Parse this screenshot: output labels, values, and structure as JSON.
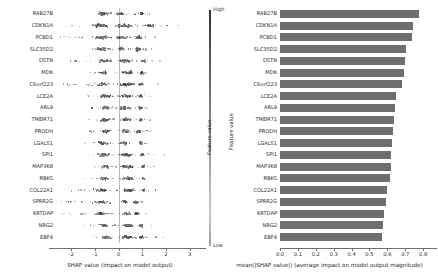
{
  "chart_data": [
    {
      "type": "scatter",
      "subtype": "shap-beeswarm",
      "title": "",
      "xlabel": "SHAP value (impact on model output)",
      "ylabel": "",
      "xlim": [
        -2.6,
        3.35
      ],
      "xticks": [
        -2,
        -1,
        0,
        1,
        2,
        3
      ],
      "xticklabels": [
        "-2",
        "-1",
        "0",
        "1",
        "2",
        "3"
      ],
      "grid": false,
      "zero_line": 0,
      "categories": [
        "RAB27B",
        "CDKN1A",
        "PCBD1",
        "SLC35D2",
        "DSTN",
        "MDK",
        "C6orf223",
        "LCE2A",
        "ARL9",
        "TMEM71",
        "PRODH",
        "LGALS1",
        "SPI1",
        "MAP3K8",
        "RBKS",
        "COL22A1",
        "SPRR2G",
        "KRTDAP",
        "NRG2",
        "EBF4"
      ],
      "colorbar": {
        "title": "Feature value",
        "high_label": "High",
        "low_label": "Low"
      },
      "series": [
        {
          "name": "RAB27B",
          "spread": [
            -1.05,
            1.35
          ],
          "clusters": [
            {
              "center": -0.62,
              "width": 0.42,
              "n": 44
            },
            {
              "center": 0.05,
              "width": 0.5,
              "n": 30
            },
            {
              "center": 0.98,
              "width": 0.2,
              "n": 26
            }
          ]
        },
        {
          "name": "CDKN1A",
          "spread": [
            -2.25,
            2.95
          ],
          "clusters": [
            {
              "center": -0.75,
              "width": 0.75,
              "n": 60
            },
            {
              "center": 0.25,
              "width": 0.85,
              "n": 58
            },
            {
              "center": 1.3,
              "width": 0.6,
              "n": 24
            }
          ]
        },
        {
          "name": "PCBD1",
          "spread": [
            -2.45,
            1.55
          ],
          "clusters": [
            {
              "center": -0.72,
              "width": 0.8,
              "n": 46
            },
            {
              "center": 0.12,
              "width": 0.45,
              "n": 26
            },
            {
              "center": 0.85,
              "width": 0.26,
              "n": 34
            }
          ]
        },
        {
          "name": "SLC35D2",
          "spread": [
            -1.6,
            1.45
          ],
          "clusters": [
            {
              "center": -0.7,
              "width": 0.6,
              "n": 40
            },
            {
              "center": 0.1,
              "width": 0.45,
              "n": 24
            },
            {
              "center": 0.82,
              "width": 0.24,
              "n": 36
            }
          ]
        },
        {
          "name": "DSTN",
          "spread": [
            -2.15,
            1.75
          ],
          "clusters": [
            {
              "center": -0.58,
              "width": 0.55,
              "n": 48
            },
            {
              "center": 0.3,
              "width": 0.7,
              "n": 50
            },
            {
              "center": 1.05,
              "width": 0.28,
              "n": 20
            }
          ]
        },
        {
          "name": "MDK",
          "spread": [
            -1.25,
            1.45
          ],
          "clusters": [
            {
              "center": -0.62,
              "width": 0.32,
              "n": 40
            },
            {
              "center": 0.38,
              "width": 0.55,
              "n": 48
            },
            {
              "center": 1.0,
              "width": 0.22,
              "n": 18
            }
          ]
        },
        {
          "name": "C6orf223",
          "spread": [
            -2.35,
            1.7
          ],
          "clusters": [
            {
              "center": -0.7,
              "width": 0.6,
              "n": 38
            },
            {
              "center": 0.35,
              "width": 0.62,
              "n": 56
            },
            {
              "center": 0.95,
              "width": 0.28,
              "n": 22
            }
          ]
        },
        {
          "name": "LCE2A",
          "spread": [
            -1.35,
            1.4
          ],
          "clusters": [
            {
              "center": -0.58,
              "width": 0.48,
              "n": 44
            },
            {
              "center": 0.35,
              "width": 0.55,
              "n": 46
            },
            {
              "center": 0.92,
              "width": 0.2,
              "n": 16
            }
          ]
        },
        {
          "name": "ARL9",
          "spread": [
            -1.15,
            1.3
          ],
          "clusters": [
            {
              "center": -0.55,
              "width": 0.38,
              "n": 42
            },
            {
              "center": 0.3,
              "width": 0.45,
              "n": 34
            },
            {
              "center": 0.92,
              "width": 0.18,
              "n": 24
            }
          ]
        },
        {
          "name": "TMEM71",
          "spread": [
            -1.25,
            1.45
          ],
          "clusters": [
            {
              "center": -0.58,
              "width": 0.4,
              "n": 44
            },
            {
              "center": 0.35,
              "width": 0.52,
              "n": 42
            },
            {
              "center": 0.95,
              "width": 0.2,
              "n": 20
            }
          ]
        },
        {
          "name": "PRODH",
          "spread": [
            -1.3,
            1.35
          ],
          "clusters": [
            {
              "center": -0.55,
              "width": 0.42,
              "n": 46
            },
            {
              "center": 0.28,
              "width": 0.4,
              "n": 28
            },
            {
              "center": 0.85,
              "width": 0.22,
              "n": 28
            }
          ]
        },
        {
          "name": "LGALS1",
          "spread": [
            -1.45,
            1.3
          ],
          "clusters": [
            {
              "center": -0.62,
              "width": 0.45,
              "n": 44
            },
            {
              "center": 0.2,
              "width": 0.42,
              "n": 24
            },
            {
              "center": 0.95,
              "width": 0.18,
              "n": 26
            }
          ]
        },
        {
          "name": "SPI1",
          "spread": [
            -1.55,
            2.35
          ],
          "clusters": [
            {
              "center": -0.6,
              "width": 0.52,
              "n": 50
            },
            {
              "center": 0.35,
              "width": 0.6,
              "n": 42
            },
            {
              "center": 1.0,
              "width": 0.26,
              "n": 18
            }
          ]
        },
        {
          "name": "MAP3K8",
          "spread": [
            -1.15,
            1.55
          ],
          "clusters": [
            {
              "center": -0.55,
              "width": 0.35,
              "n": 38
            },
            {
              "center": 0.38,
              "width": 0.62,
              "n": 52
            },
            {
              "center": 1.05,
              "width": 0.22,
              "n": 16
            }
          ]
        },
        {
          "name": "RBKS",
          "spread": [
            -1.45,
            1.45
          ],
          "clusters": [
            {
              "center": -0.6,
              "width": 0.5,
              "n": 34
            },
            {
              "center": 0.45,
              "width": 0.55,
              "n": 50
            },
            {
              "center": 1.05,
              "width": 0.2,
              "n": 16
            }
          ]
        },
        {
          "name": "COL22A1",
          "spread": [
            -2.3,
            1.55
          ],
          "clusters": [
            {
              "center": -0.72,
              "width": 0.62,
              "n": 36
            },
            {
              "center": 0.42,
              "width": 0.55,
              "n": 52
            },
            {
              "center": 1.05,
              "width": 0.2,
              "n": 16
            }
          ]
        },
        {
          "name": "SPRR2G",
          "spread": [
            -2.45,
            1.35
          ],
          "clusters": [
            {
              "center": -0.7,
              "width": 0.72,
              "n": 34
            },
            {
              "center": 0.25,
              "width": 0.3,
              "n": 20
            },
            {
              "center": 0.72,
              "width": 0.16,
              "n": 30
            }
          ]
        },
        {
          "name": "KRTDAP",
          "spread": [
            -2.45,
            1.45
          ],
          "clusters": [
            {
              "center": -0.75,
              "width": 0.7,
              "n": 36
            },
            {
              "center": 0.35,
              "width": 0.45,
              "n": 30
            },
            {
              "center": 0.78,
              "width": 0.22,
              "n": 34
            }
          ]
        },
        {
          "name": "NRG2",
          "spread": [
            -1.45,
            1.45
          ],
          "clusters": [
            {
              "center": -0.58,
              "width": 0.42,
              "n": 40
            },
            {
              "center": 0.42,
              "width": 0.5,
              "n": 44
            },
            {
              "center": 0.95,
              "width": 0.18,
              "n": 18
            }
          ]
        },
        {
          "name": "EBF4",
          "spread": [
            -1.3,
            1.95
          ],
          "clusters": [
            {
              "center": -0.52,
              "width": 0.42,
              "n": 46
            },
            {
              "center": 0.35,
              "width": 0.55,
              "n": 44
            },
            {
              "center": 0.95,
              "width": 0.22,
              "n": 18
            }
          ]
        }
      ]
    },
    {
      "type": "bar",
      "subtype": "shap-mean-abs",
      "orientation": "horizontal",
      "title": "",
      "xlabel": "mean(|SHAP value|) (average impact on model output magnitude)",
      "ylabel": "Feature value",
      "xlim": [
        0.0,
        0.855
      ],
      "xticks": [
        0.0,
        0.1,
        0.2,
        0.3,
        0.4,
        0.5,
        0.6,
        0.7,
        0.8
      ],
      "xticklabels": [
        "0.0",
        "0.1",
        "0.2",
        "0.3",
        "0.4",
        "0.5",
        "0.6",
        "0.7",
        "0.8"
      ],
      "grid": false,
      "bar_color": "#6e6e6e",
      "categories": [
        "RAB27B",
        "CDKN1A",
        "PCBD1",
        "SLC35D2",
        "DSTN",
        "MDK",
        "C6orf223",
        "LCE2A",
        "ARL9",
        "TMEM71",
        "PRODH",
        "LGALS1",
        "SPI1",
        "MAP3K8",
        "RBKS",
        "COL22A1",
        "SPRR2G",
        "KRTDAP",
        "NRG2",
        "EBF4"
      ],
      "values": [
        0.775,
        0.745,
        0.735,
        0.705,
        0.7,
        0.695,
        0.68,
        0.65,
        0.645,
        0.635,
        0.63,
        0.625,
        0.62,
        0.618,
        0.615,
        0.6,
        0.595,
        0.58,
        0.575,
        0.57
      ]
    }
  ],
  "left_panel": {
    "axis_title": "SHAP value (impact on model output)",
    "xticklabels": [
      "-2",
      "-1",
      "0",
      "1",
      "2",
      "3"
    ],
    "feature_labels": [
      "RAB27B",
      "CDKN1A",
      "PCBD1",
      "SLC35D2",
      "DSTN",
      "MDK",
      "C6orf223",
      "LCE2A",
      "ARL9",
      "TMEM71",
      "PRODH",
      "LGALS1",
      "SPI1",
      "MAP3K8",
      "RBKS",
      "COL22A1",
      "SPRR2G",
      "KRTDAP",
      "NRG2",
      "EBF4"
    ],
    "colorbar": {
      "high": "High",
      "low": "Low",
      "title": "Feature value"
    }
  },
  "right_panel": {
    "axis_title": "mean(|SHAP value|) (average impact on model output magnitude)",
    "ylabel": "Feature value",
    "xticklabels": [
      "0.0",
      "0.1",
      "0.2",
      "0.3",
      "0.4",
      "0.5",
      "0.6",
      "0.7",
      "0.8"
    ],
    "feature_labels": [
      "RAB27B",
      "CDKN1A",
      "PCBD1",
      "SLC35D2",
      "DSTN",
      "MDK",
      "C6orf223",
      "LCE2A",
      "ARL9",
      "TMEM71",
      "PRODH",
      "LGALS1",
      "SPI1",
      "MAP3K8",
      "RBKS",
      "COL22A1",
      "SPRR2G",
      "KRTDAP",
      "NRG2",
      "EBF4"
    ]
  },
  "colors": {
    "bar": "#6e6e6e",
    "axis": "#6f6f6f",
    "zero_line": "#b9b9b9",
    "text": "#1f1f1f"
  }
}
